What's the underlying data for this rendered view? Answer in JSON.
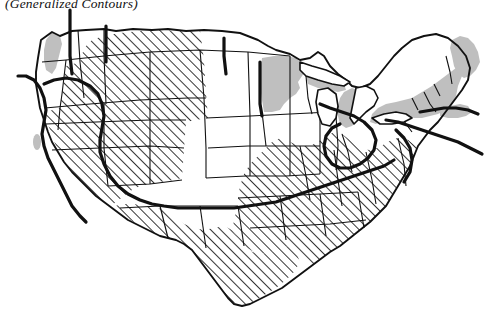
{
  "figure": {
    "caption": "(Generalized Contours)",
    "background_color": "#ffffff"
  },
  "legend_classes": [
    {
      "id": "hatched",
      "pattern": "diagonal-hatch",
      "angle_degrees": 45,
      "line_color": "#111111",
      "spacing_px": 7,
      "description": "Diagonal line hatching"
    },
    {
      "id": "white",
      "pattern": "solid-fill",
      "fill_color": "#ffffff",
      "description": "Unshaded / white"
    },
    {
      "id": "gray",
      "pattern": "solid-fill",
      "fill_color": "#bfbfbf",
      "description": "Gray tone"
    }
  ],
  "map": {
    "outline_color": "#111111",
    "state_border_color": "#111111",
    "state_border_width": 1.1,
    "coastline_width": 1.8,
    "contour_color": "#111111",
    "contour_width": 3.2,
    "regions": [
      {
        "name": "washington-coast",
        "class": "gray"
      },
      {
        "name": "washington-inland",
        "class": "white"
      },
      {
        "name": "oregon",
        "class": "white"
      },
      {
        "name": "california-coast",
        "class": "white"
      },
      {
        "name": "california-bay-spot",
        "class": "gray"
      },
      {
        "name": "california-inland",
        "class": "hatched"
      },
      {
        "name": "idaho",
        "class": "hatched"
      },
      {
        "name": "nevada",
        "class": "hatched"
      },
      {
        "name": "utah",
        "class": "hatched"
      },
      {
        "name": "arizona",
        "class": "hatched"
      },
      {
        "name": "montana",
        "class": "hatched"
      },
      {
        "name": "wyoming",
        "class": "hatched"
      },
      {
        "name": "colorado",
        "class": "hatched"
      },
      {
        "name": "new-mexico",
        "class": "hatched"
      },
      {
        "name": "texas",
        "class": "hatched"
      },
      {
        "name": "oklahoma",
        "class": "hatched"
      },
      {
        "name": "north-dakota",
        "class": "white"
      },
      {
        "name": "south-dakota",
        "class": "white"
      },
      {
        "name": "nebraska",
        "class": "white"
      },
      {
        "name": "kansas",
        "class": "white"
      },
      {
        "name": "minnesota",
        "class": "gray"
      },
      {
        "name": "iowa",
        "class": "white"
      },
      {
        "name": "missouri",
        "class": "white"
      },
      {
        "name": "arkansas",
        "class": "hatched"
      },
      {
        "name": "louisiana",
        "class": "hatched"
      },
      {
        "name": "wisconsin",
        "class": "white"
      },
      {
        "name": "illinois",
        "class": "white"
      },
      {
        "name": "michigan",
        "class": "gray"
      },
      {
        "name": "indiana",
        "class": "white"
      },
      {
        "name": "ohio",
        "class": "white"
      },
      {
        "name": "kentucky",
        "class": "hatched"
      },
      {
        "name": "tennessee",
        "class": "hatched"
      },
      {
        "name": "mississippi",
        "class": "hatched"
      },
      {
        "name": "alabama",
        "class": "hatched"
      },
      {
        "name": "georgia",
        "class": "hatched"
      },
      {
        "name": "florida",
        "class": "hatched"
      },
      {
        "name": "south-carolina",
        "class": "hatched"
      },
      {
        "name": "north-carolina",
        "class": "hatched"
      },
      {
        "name": "virginia",
        "class": "hatched"
      },
      {
        "name": "west-virginia",
        "class": "hatched"
      },
      {
        "name": "pennsylvania",
        "class": "white"
      },
      {
        "name": "new-york",
        "class": "gray"
      },
      {
        "name": "vermont",
        "class": "gray"
      },
      {
        "name": "new-hampshire",
        "class": "gray"
      },
      {
        "name": "maine",
        "class": "gray"
      },
      {
        "name": "massachusetts",
        "class": "gray"
      },
      {
        "name": "new-jersey",
        "class": "white"
      },
      {
        "name": "maryland",
        "class": "white"
      }
    ],
    "contour_lines": [
      {
        "name": "pacific-northwest-contour",
        "description": "Vertical contour crossing Washington, extending above the border"
      },
      {
        "name": "idaho-montana-contour",
        "description": "Vertical contour at Idaho/Montana boundary"
      },
      {
        "name": "dakota-contour",
        "description": "Vertical contour through the Dakotas"
      },
      {
        "name": "california-coast-contour",
        "description": "Contour running along the California coast, extending into the Pacific"
      },
      {
        "name": "western-boundary-contour",
        "description": "Long contour separating hatched West from white Plains"
      },
      {
        "name": "ohio-valley-contour",
        "description": "Wavy contour looping through the Ohio Valley"
      },
      {
        "name": "atlantic-contour",
        "description": "Contour extending east past the Atlantic coastline"
      }
    ]
  }
}
